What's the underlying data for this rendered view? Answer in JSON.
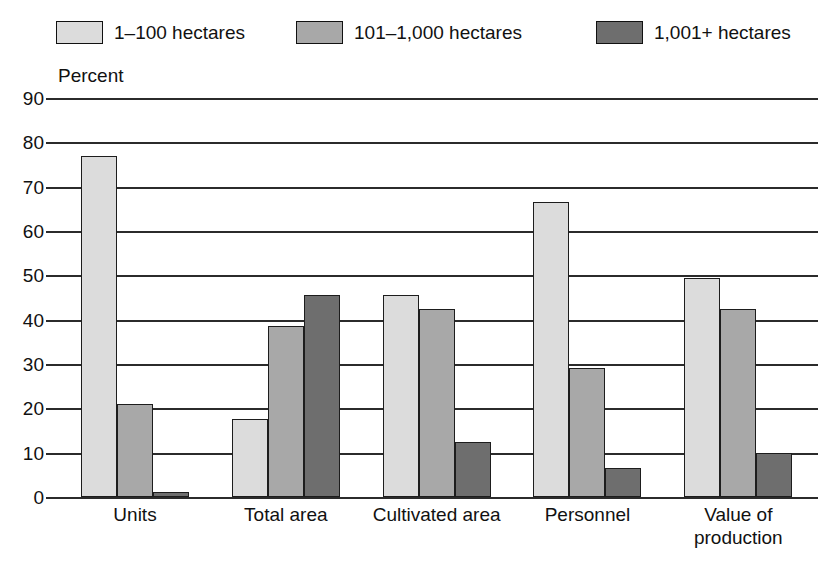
{
  "chart_data": {
    "type": "bar",
    "title": "",
    "subtitle": "",
    "xlabel": "",
    "ylabel": "Percent",
    "ylim": [
      0,
      90
    ],
    "ytick_step": 10,
    "yticks": [
      90,
      80,
      70,
      60,
      50,
      40,
      30,
      20,
      10,
      0
    ],
    "grid": true,
    "legend_position": "top",
    "categories": [
      "Units",
      "Total area",
      "Cultivated area",
      "Personnel",
      "Value of\nproduction"
    ],
    "series": [
      {
        "name": "1–100 hectares",
        "color": "#dcdcdc",
        "values": [
          77,
          17.5,
          45.5,
          66.5,
          49.5
        ]
      },
      {
        "name": "101–1,000 hectares",
        "color": "#a8a8a8",
        "values": [
          21,
          38.5,
          42.5,
          29,
          42.5
        ]
      },
      {
        "name": "1,001+ hectares",
        "color": "#6e6e6e",
        "values": [
          1.2,
          45.5,
          12.5,
          6.5,
          10
        ]
      }
    ]
  },
  "legend": {
    "items": [
      {
        "label": "1–100 hectares",
        "color": "#dcdcdc"
      },
      {
        "label": "101–1,000 hectares",
        "color": "#a8a8a8"
      },
      {
        "label": "1,001+ hectares",
        "color": "#6e6e6e"
      }
    ]
  },
  "axis": {
    "y_title": "Percent",
    "y_tick_labels": [
      "90",
      "80",
      "70",
      "60",
      "50",
      "40",
      "30",
      "20",
      "10",
      "0"
    ]
  },
  "colors": {
    "series_light": "#dcdcdc",
    "series_medium": "#a8a8a8",
    "series_dark": "#6e6e6e",
    "ink": "#111111",
    "grid": "#2b2b2b",
    "background": "#ffffff"
  }
}
